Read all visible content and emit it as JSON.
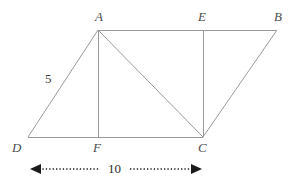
{
  "figure": {
    "type": "geometry-diagram",
    "shape": "parallelogram-with-altitudes",
    "background_color": "#ffffff",
    "stroke_color": "#9a9a9a",
    "label_color": "#4d4d4d",
    "stroke_width": 1,
    "canvas": {
      "width": 289,
      "height": 181
    }
  },
  "vertices": [
    {
      "id": "A",
      "label": "A",
      "x": 98,
      "y": 30,
      "label_x": 95,
      "label_y": 10
    },
    {
      "id": "E",
      "label": "E",
      "x": 203,
      "y": 30,
      "label_x": 198,
      "label_y": 10
    },
    {
      "id": "B",
      "label": "B",
      "x": 277,
      "y": 30,
      "label_x": 274,
      "label_y": 10
    },
    {
      "id": "D",
      "label": "D",
      "x": 28,
      "y": 137,
      "label_x": 12,
      "label_y": 141
    },
    {
      "id": "F",
      "label": "F",
      "x": 98,
      "y": 137,
      "label_x": 93,
      "label_y": 141
    },
    {
      "id": "C",
      "label": "C",
      "x": 203,
      "y": 137,
      "label_x": 198,
      "label_y": 141
    }
  ],
  "segments": [
    {
      "name": "segment-A-B",
      "from": "A",
      "to": "B"
    },
    {
      "name": "segment-D-C",
      "from": "D",
      "to": "C"
    },
    {
      "name": "segment-D-A",
      "from": "D",
      "to": "A"
    },
    {
      "name": "segment-C-B",
      "from": "C",
      "to": "B"
    },
    {
      "name": "segment-A-F",
      "from": "A",
      "to": "F"
    },
    {
      "name": "segment-E-C",
      "from": "E",
      "to": "C"
    },
    {
      "name": "segment-A-C",
      "from": "A",
      "to": "C"
    }
  ],
  "annotations": {
    "side_label": {
      "name": "side-length-5",
      "text": "5",
      "x": 45,
      "y": 72
    },
    "dimension": {
      "name": "base-dimension-10",
      "text": "10",
      "label_x": 108,
      "label_y": 162,
      "line_y": 169,
      "x_start": 30,
      "x_end": 202,
      "style": "dotted-double-arrow",
      "color": "#1a1a1a"
    }
  }
}
